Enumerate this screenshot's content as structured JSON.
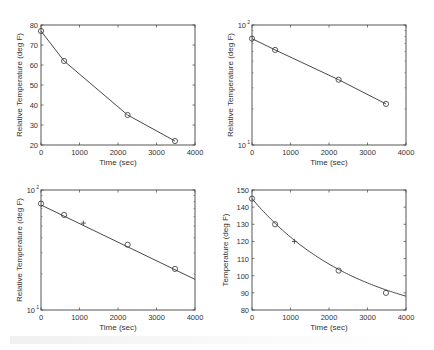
{
  "chart_data": [
    {
      "id": "top-left",
      "type": "line",
      "title": "",
      "xlabel": "Time (sec)",
      "ylabel": "Relative Temperature (deg F)",
      "xlim": [
        0,
        4000
      ],
      "ylim": [
        20,
        80
      ],
      "yscale": "linear",
      "xticks": [
        0,
        1000,
        2000,
        3000,
        4000
      ],
      "yticks": [
        20,
        30,
        40,
        50,
        60,
        70,
        80
      ],
      "ytick_labels": [
        "20",
        "30",
        "40",
        "50",
        "60",
        "70",
        "80"
      ],
      "grid": false,
      "series": [
        {
          "name": "measured",
          "marker": "o",
          "line": true,
          "x": [
            0,
            600,
            2250,
            3480
          ],
          "y": [
            77,
            62,
            35,
            22
          ]
        }
      ],
      "box": {
        "x0": 41,
        "y0": 25,
        "x1": 195,
        "y1": 145
      }
    },
    {
      "id": "top-right",
      "type": "line",
      "title": "",
      "xlabel": "Time (sec)",
      "ylabel": "Relative Temperature (deg F)",
      "xlim": [
        0,
        4000
      ],
      "ylim": [
        10,
        100
      ],
      "yscale": "log",
      "xticks": [
        0,
        1000,
        2000,
        3000,
        4000
      ],
      "yticks": [
        10,
        100
      ],
      "ytick_labels": [
        "10^1",
        "10^2"
      ],
      "grid": false,
      "series": [
        {
          "name": "measured",
          "marker": "o",
          "line": true,
          "x": [
            0,
            600,
            2250,
            3480
          ],
          "y": [
            77,
            62,
            35,
            22
          ]
        }
      ],
      "box": {
        "x0": 252,
        "y0": 25,
        "x1": 406,
        "y1": 145
      }
    },
    {
      "id": "bottom-left",
      "type": "line",
      "title": "",
      "xlabel": "Time (sec)",
      "ylabel": "Relative Temperature (deg F)",
      "xlim": [
        0,
        4000
      ],
      "ylim": [
        10,
        100
      ],
      "yscale": "log",
      "xticks": [
        0,
        1000,
        2000,
        3000,
        4000
      ],
      "yticks": [
        10,
        100
      ],
      "ytick_labels": [
        "10^1",
        "10^2"
      ],
      "grid": false,
      "series": [
        {
          "name": "measured",
          "marker": "o",
          "line": false,
          "x": [
            0,
            600,
            2250,
            3480
          ],
          "y": [
            77,
            62,
            35,
            22
          ]
        },
        {
          "name": "exponential fit",
          "marker": "",
          "line": true,
          "x": [
            0,
            4000
          ],
          "y": [
            75,
            18
          ]
        },
        {
          "name": "interpolated",
          "marker": "+",
          "line": false,
          "x": [
            1100
          ],
          "y": [
            53
          ]
        }
      ],
      "box": {
        "x0": 41,
        "y0": 190,
        "x1": 195,
        "y1": 310
      }
    },
    {
      "id": "bottom-right",
      "type": "line",
      "title": "",
      "xlabel": "Time (sec)",
      "ylabel": "Temperature (deg F)",
      "xlim": [
        0,
        4000
      ],
      "ylim": [
        80,
        150
      ],
      "yscale": "linear",
      "xticks": [
        0,
        1000,
        2000,
        3000,
        4000
      ],
      "yticks": [
        80,
        90,
        100,
        110,
        120,
        130,
        140,
        150
      ],
      "ytick_labels": [
        "80",
        "90",
        "100",
        "110",
        "120",
        "130",
        "140",
        "150"
      ],
      "grid": false,
      "series": [
        {
          "name": "measured",
          "marker": "o",
          "line": false,
          "x": [
            0,
            600,
            2250,
            3480
          ],
          "y": [
            145,
            130,
            103,
            90
          ]
        },
        {
          "name": "exponential fit",
          "marker": "",
          "line": true,
          "fit": {
            "ambient": 68,
            "a": 75,
            "k": 0.000356
          },
          "x": [
            0,
            4000
          ],
          "y": [
            143,
            86
          ]
        },
        {
          "name": "interpolated",
          "marker": "+",
          "line": false,
          "x": [
            1100
          ],
          "y": [
            120
          ]
        }
      ],
      "box": {
        "x0": 252,
        "y0": 190,
        "x1": 406,
        "y1": 310
      }
    }
  ],
  "colors": {
    "axis": "#444444",
    "line": "#333333",
    "text": "#333333",
    "background": "#ffffff"
  }
}
